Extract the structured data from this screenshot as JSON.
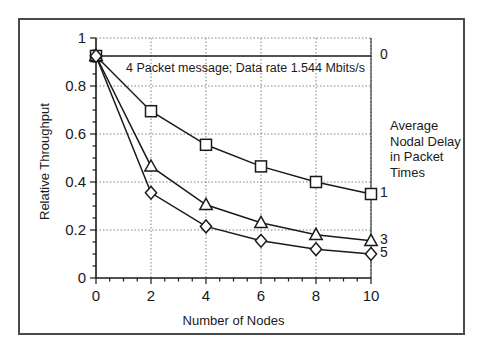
{
  "chart_data": {
    "type": "line",
    "title": "",
    "annotation": "4 Packet message; Data rate 1.544 Mbits/s",
    "xlabel": "Number of Nodes",
    "ylabel": "Relative Throughput",
    "xlim": [
      0,
      10
    ],
    "ylim": [
      0,
      1
    ],
    "xticks": [
      "0",
      "2",
      "4",
      "6",
      "8",
      "10"
    ],
    "xtick_values": [
      0,
      2,
      4,
      6,
      8,
      10
    ],
    "yticks": [
      "0",
      "0.2",
      "0.4",
      "0.6",
      "0.8",
      "1"
    ],
    "ytick_values": [
      0,
      0.2,
      0.4,
      0.6,
      0.8,
      1
    ],
    "xminor_step": 0.5,
    "yminor_step": 0.05,
    "grid": true,
    "grid_style": "dotted",
    "legend_position": "right-of-axes",
    "legend_title": [
      "Average",
      "Nodal Delay",
      "in Packet",
      "Times"
    ],
    "x": [
      0,
      2,
      4,
      6,
      8,
      10
    ],
    "series": [
      {
        "name": "0",
        "label": "0",
        "marker": "none",
        "values": [
          0.925,
          0.925,
          0.925,
          0.925,
          0.925,
          0.925
        ],
        "label_y": 0.925
      },
      {
        "name": "1",
        "label": "1",
        "marker": "square",
        "values": [
          0.925,
          0.695,
          0.555,
          0.465,
          0.4,
          0.35
        ],
        "label_y": 0.35
      },
      {
        "name": "3",
        "label": "3",
        "marker": "triangle",
        "values": [
          0.925,
          0.465,
          0.305,
          0.23,
          0.18,
          0.155
        ],
        "label_y": 0.155
      },
      {
        "name": "5",
        "label": "5",
        "marker": "diamond",
        "values": [
          0.925,
          0.355,
          0.215,
          0.155,
          0.12,
          0.1
        ],
        "label_y": 0.1
      }
    ],
    "colors": {
      "line": "#1a1a1a",
      "grid": "#808080",
      "axis": "#1a1a1a",
      "frame": "#4a4a4a",
      "background": "#ffffff"
    }
  }
}
